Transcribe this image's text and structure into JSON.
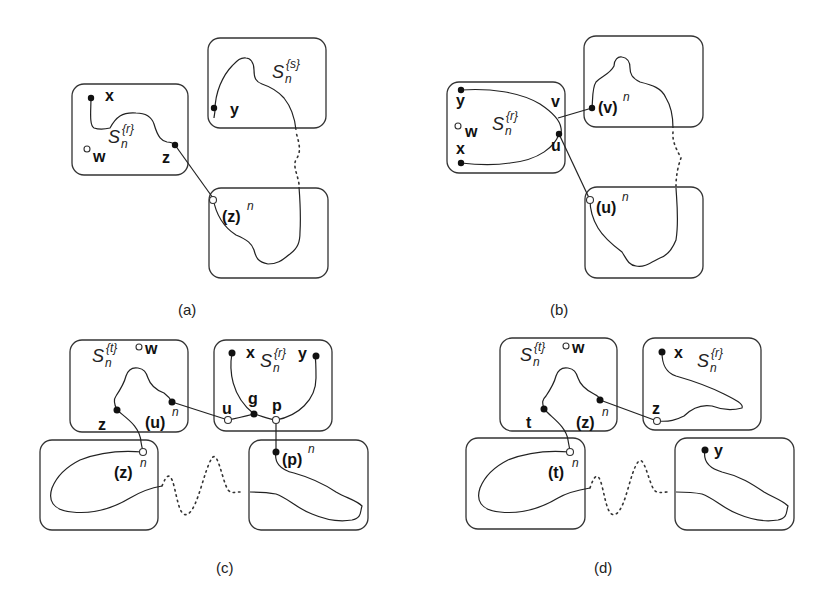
{
  "panels": {
    "a": {
      "caption": "(a)",
      "labels": {
        "x": "x",
        "w": "w",
        "z": "z",
        "y": "y",
        "zn_base": "(z)",
        "zn_exp": "n",
        "S": "S",
        "S_sub": "n",
        "Sr_sup": "{r}",
        "Ss_sup": "{s}"
      }
    },
    "b": {
      "caption": "(b)",
      "labels": {
        "y": "y",
        "w": "w",
        "x": "x",
        "v": "v",
        "u": "u",
        "vn_base": "(v)",
        "vn_exp": "n",
        "un_base": "(u)",
        "un_exp": "n",
        "S": "S",
        "S_sub": "n",
        "Sr_sup": "{r}"
      }
    },
    "c": {
      "caption": "(c)",
      "labels": {
        "w": "w",
        "z": "z",
        "x": "x",
        "y": "y",
        "g": "g",
        "u": "u",
        "p": "p",
        "un_base": "(u)",
        "un_exp": "n",
        "zn_base": "(z)",
        "zn_exp": "n",
        "pn_base": "(p)",
        "pn_exp": "n",
        "S": "S",
        "S_sub": "n",
        "St_sup": "{t}",
        "Sr_sup": "{r}"
      }
    },
    "d": {
      "caption": "(d)",
      "labels": {
        "w": "w",
        "t": "t",
        "x": "x",
        "z": "z",
        "y": "y",
        "zn_base": "(z)",
        "zn_exp": "n",
        "tn_base": "(t)",
        "tn_exp": "n",
        "S": "S",
        "S_sub": "n",
        "St_sup": "{t}",
        "Sr_sup": "{r}"
      }
    }
  }
}
